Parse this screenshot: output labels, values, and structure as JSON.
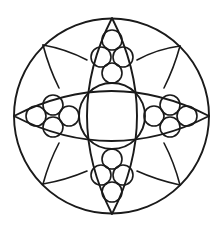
{
  "figure": {
    "title": "",
    "stroke_color": "#1a1a1a",
    "background": "#ffffff",
    "outer_circle": {
      "cx": 111.5,
      "cy": 116,
      "r": 97.5
    },
    "central_circle": {
      "cx": 112,
      "cy": 116,
      "r": 33
    },
    "vertical_lens": {
      "top": [
        112,
        18
      ],
      "bottom": [
        112,
        214
      ],
      "half_width": 37
    },
    "horizontal_lens": {
      "left": [
        14,
        116
      ],
      "right": [
        209,
        116
      ],
      "half_height": 37
    },
    "small_circle_radius": 10,
    "clusters": [
      {
        "name": "top",
        "circles": [
          [
            112,
            40
          ],
          [
            101,
            57
          ],
          [
            123,
            57
          ],
          [
            112,
            73
          ]
        ]
      },
      {
        "name": "bottom",
        "circles": [
          [
            112,
            192
          ],
          [
            101,
            175
          ],
          [
            123,
            175
          ],
          [
            112,
            159
          ]
        ]
      },
      {
        "name": "left",
        "circles": [
          [
            36,
            116
          ],
          [
            53,
            105
          ],
          [
            53,
            127
          ],
          [
            69,
            116
          ]
        ]
      },
      {
        "name": "right",
        "circles": [
          [
            187,
            116
          ],
          [
            170,
            105
          ],
          [
            170,
            127
          ],
          [
            154,
            116
          ]
        ]
      }
    ],
    "diagonal_vertices": [
      [
        43,
        45
      ],
      [
        180,
        46
      ],
      [
        43,
        184
      ],
      [
        180,
        185
      ]
    ]
  }
}
